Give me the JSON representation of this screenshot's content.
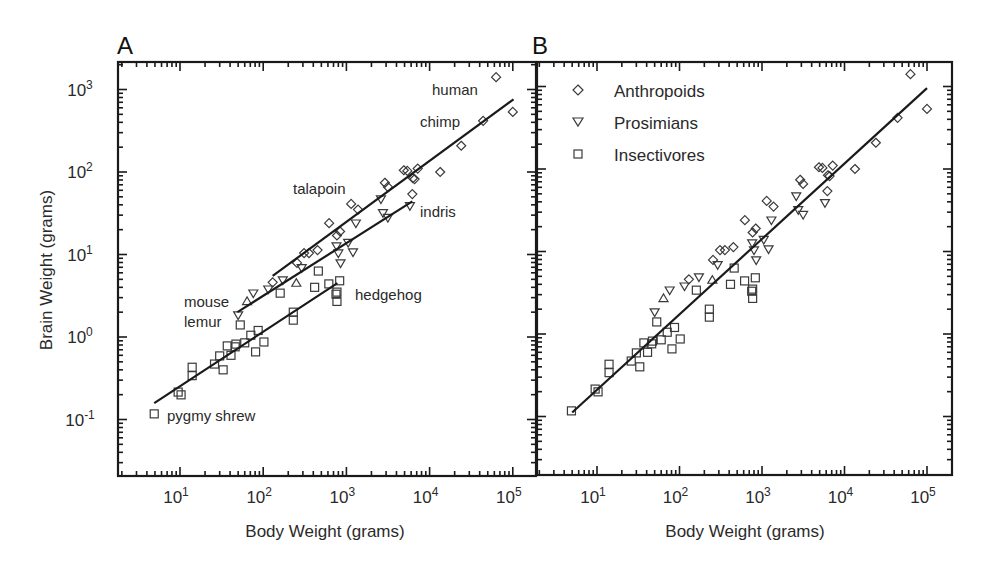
{
  "figure": {
    "panels": [
      "A",
      "B"
    ],
    "x_axis_title": "Body Weight (grams)",
    "y_axis_title": "Brain Weight (grams)"
  },
  "legend": {
    "items": [
      {
        "label": "Anthropoids",
        "marker": "diamond"
      },
      {
        "label": "Prosimians",
        "marker": "triangle-down"
      },
      {
        "label": "Insectivores",
        "marker": "square"
      }
    ]
  },
  "annotations": [
    {
      "text": "human",
      "panel": "A"
    },
    {
      "text": "chimp",
      "panel": "A"
    },
    {
      "text": "talapoin",
      "panel": "A"
    },
    {
      "text": "indris",
      "panel": "A"
    },
    {
      "text": "mouse",
      "panel": "A"
    },
    {
      "text": "lemur",
      "panel": "A"
    },
    {
      "text": "hedgehog",
      "panel": "A"
    },
    {
      "text": "pygmy shrew",
      "panel": "A"
    }
  ],
  "chart_data": [
    {
      "panel": "A",
      "type": "scatter",
      "title": "A",
      "xlabel": "Body Weight (grams)",
      "ylabel": "Brain Weight (grams)",
      "xscale": "log",
      "yscale": "log",
      "xlim": [
        2,
        200000
      ],
      "ylim": [
        0.03,
        1800
      ],
      "xticks": [
        "10^1",
        "10^2",
        "10^3",
        "10^4",
        "10^5"
      ],
      "yticks": [
        "10^-1",
        "10^0",
        "10^1",
        "10^2",
        "10^3"
      ],
      "grid": false,
      "legend": false,
      "series": [
        {
          "name": "Anthropoids",
          "marker": "diamond",
          "points": [
            [
              63000,
              1410
            ],
            [
              100000,
              535
            ],
            [
              44000,
              417
            ],
            [
              24000,
              208
            ],
            [
              13400,
              100
            ],
            [
              7200,
              110
            ],
            [
              4900,
              105
            ],
            [
              5400,
              103
            ],
            [
              6300,
              84
            ],
            [
              6600,
              82
            ],
            [
              6200,
              54
            ],
            [
              2900,
              74
            ],
            [
              3150,
              66
            ],
            [
              1140,
              41
            ],
            [
              1380,
              35
            ],
            [
              620,
              24
            ],
            [
              840,
              19
            ],
            [
              770,
              17
            ],
            [
              450,
              11.3
            ],
            [
              355,
              10.4
            ],
            [
              310,
              10.4
            ],
            [
              255,
              7.9
            ],
            [
              130,
              4.6
            ]
          ],
          "fit": [
            [
              130,
              5.5
            ],
            [
              102000,
              760
            ]
          ]
        },
        {
          "name": "Prosimians",
          "marker": "triangle-down",
          "points": [
            [
              50,
              1.85
            ],
            [
              76,
              3.4
            ],
            [
              115,
              3.8
            ],
            [
              172,
              4.9
            ],
            [
              290,
              6.9
            ],
            [
              760,
              12.7
            ],
            [
              800,
              10.4
            ],
            [
              850,
              7.9
            ],
            [
              1050,
              14
            ],
            [
              1200,
              10.7
            ],
            [
              1300,
              24
            ],
            [
              2750,
              32
            ],
            [
              3150,
              28
            ],
            [
              2600,
              47
            ],
            [
              5800,
              39
            ]
          ],
          "up_triangles": [
            [
              64,
              2.7
            ],
            [
              250,
              4.5
            ]
          ],
          "fit": [
            [
              49,
              2.0
            ],
            [
              6200,
              44
            ]
          ]
        },
        {
          "name": "Insectivores",
          "marker": "square",
          "points": [
            [
              4.9,
              0.117
            ],
            [
              9.5,
              0.215
            ],
            [
              10.3,
              0.199
            ],
            [
              14,
              0.43
            ],
            [
              14,
              0.34
            ],
            [
              26,
              0.47
            ],
            [
              30,
              0.59
            ],
            [
              33,
              0.4
            ],
            [
              41,
              0.6
            ],
            [
              37,
              0.78
            ],
            [
              46,
              0.76
            ],
            [
              47,
              0.82
            ],
            [
              60,
              0.85
            ],
            [
              71,
              1.05
            ],
            [
              87,
              1.2
            ],
            [
              81,
              0.66
            ],
            [
              102,
              0.87
            ],
            [
              53,
              1.4
            ],
            [
              230,
              2.0
            ],
            [
              230,
              1.6
            ],
            [
              160,
              3.4
            ],
            [
              415,
              4.0
            ],
            [
              460,
              6.3
            ],
            [
              615,
              4.4
            ],
            [
              830,
              4.8
            ],
            [
              770,
              3.5
            ],
            [
              750,
              3.3
            ],
            [
              770,
              2.7
            ]
          ],
          "fit": [
            [
              4.9,
              0.158
            ],
            [
              780,
              4.5
            ]
          ]
        }
      ],
      "labels": [
        {
          "text": "human",
          "x": 432,
          "y": 95
        },
        {
          "text": "chimp",
          "x": 420,
          "y": 127
        },
        {
          "text": "talapoin",
          "x": 293,
          "y": 194
        },
        {
          "text": "indris",
          "x": 420,
          "y": 217
        },
        {
          "text": "mouse",
          "x": 184,
          "y": 307
        },
        {
          "text": "lemur",
          "x": 184,
          "y": 327
        },
        {
          "text": "hedgehog",
          "x": 355,
          "y": 300
        },
        {
          "text": "pygmy shrew",
          "x": 167,
          "y": 421
        }
      ]
    },
    {
      "panel": "B",
      "type": "scatter",
      "title": "B",
      "xlabel": "Body Weight (grams)",
      "ylabel": "",
      "xscale": "log",
      "yscale": "log",
      "xlim": [
        2,
        200000
      ],
      "ylim": [
        0.03,
        1800
      ],
      "xticks": [
        "10^1",
        "10^2",
        "10^3",
        "10^4",
        "10^5"
      ],
      "grid": false,
      "legend": true,
      "legend_position": "upper left",
      "series_same_as_panel": "A",
      "single_fit": [
        [
          5.0,
          0.112
        ],
        [
          100000,
          955
        ]
      ]
    }
  ]
}
